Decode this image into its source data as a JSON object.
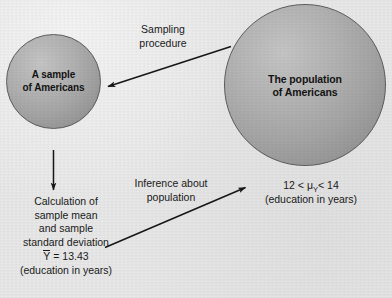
{
  "diagram": {
    "background_color": "#e9e9e9",
    "ink_color": "#1a1a1a",
    "sphere_fill": "#a6a6a6",
    "sphere_stroke": "#5d5d5d"
  },
  "sample_circle": {
    "label_line1": "A sample",
    "label_line2": "of Americans"
  },
  "population_circle": {
    "label_line1": "The population",
    "label_line2": "of Americans"
  },
  "sampling_arrow": {
    "label_line1": "Sampling",
    "label_line2": "procedure",
    "from": "population-circle",
    "to": "sample-circle"
  },
  "calculation_arrow": {
    "from": "sample-circle",
    "to": "calculation-block"
  },
  "inference_arrow": {
    "label_line1": "Inference about",
    "label_line2": "population",
    "from": "calculation-block",
    "to": "interval-block"
  },
  "calculation_block": {
    "lines": [
      "Calculation of",
      "sample mean",
      "and sample",
      "standard deviation"
    ],
    "statistic_symbol": "Y",
    "statistic_equals": "= 13.43",
    "units_note": "(education in years)"
  },
  "interval_block": {
    "lower_bound": "12",
    "operator_left": "<",
    "parameter_symbol": "μ",
    "parameter_subscript": "Y",
    "operator_right": "<",
    "upper_bound": "14",
    "units_note": "(education in years)"
  }
}
